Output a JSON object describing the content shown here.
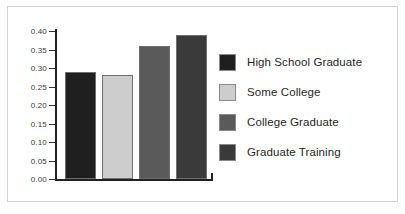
{
  "chart_data": {
    "type": "bar",
    "title": "",
    "xlabel": "",
    "ylabel": "",
    "categories": [
      "High School Graduate",
      "Some College",
      "College Graduate",
      "Graduate Training"
    ],
    "values": [
      0.29,
      0.28,
      0.36,
      0.39
    ],
    "ylim": [
      0.0,
      0.4
    ],
    "ytick_labels": [
      "0.40",
      "0.35",
      "0.30",
      "0.25",
      "0.20",
      "0.15",
      "0.10",
      "0.05",
      "0.00"
    ],
    "ytick_values": [
      0.4,
      0.35,
      0.3,
      0.25,
      0.2,
      0.15,
      0.1,
      0.05,
      0.0
    ],
    "xtick_labels": [],
    "grid": false,
    "legend_position": "right",
    "series": [
      {
        "name": "High School Graduate",
        "value": 0.29,
        "color": "#201f1f"
      },
      {
        "name": "Some College",
        "value": 0.28,
        "color": "#cdcdcd"
      },
      {
        "name": "College Graduate",
        "value": 0.36,
        "color": "#5a5a5a"
      },
      {
        "name": "Graduate Training",
        "value": 0.39,
        "color": "#3a3a3a"
      }
    ]
  },
  "legend": {
    "items": [
      {
        "label": "High School Graduate",
        "color": "#201f1f"
      },
      {
        "label": "Some College",
        "color": "#cdcdcd"
      },
      {
        "label": "College Graduate",
        "color": "#5a5a5a"
      },
      {
        "label": "Graduate Training",
        "color": "#3a3a3a"
      }
    ]
  },
  "colors": {
    "axis": "#222222",
    "frame_border": "#d2d2d2",
    "background": "#ffffff",
    "tick_text": "#3a3a3a",
    "legend_text": "#1f1f1f"
  }
}
